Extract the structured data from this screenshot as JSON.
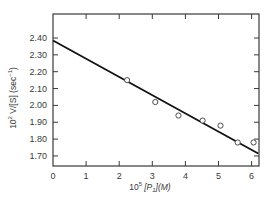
{
  "chart_data": {
    "type": "scatter",
    "title": "",
    "xlabel": "10^5 [P1](M)",
    "ylabel": "10^2 V/[S] (sec^-1)",
    "xlim": [
      0,
      6.2
    ],
    "ylim": [
      1.65,
      2.54
    ],
    "x_ticks": [
      0,
      1,
      2,
      3,
      4,
      5,
      6
    ],
    "x_tick_labels": [
      "0",
      "1",
      "2",
      "3",
      "4",
      "5",
      "6"
    ],
    "y_ticks": [
      1.7,
      1.8,
      1.9,
      2.0,
      2.1,
      2.2,
      2.3,
      2.4
    ],
    "y_tick_labels": [
      "1.70",
      "1.80",
      "1.90",
      "2.00",
      "2.10",
      "2.20",
      "2.30",
      "2.40"
    ],
    "grid": false,
    "legend": null,
    "series": [
      {
        "name": "observed",
        "marker": "open-circle",
        "x": [
          2.24,
          3.09,
          3.79,
          4.52,
          5.06,
          5.58,
          6.06
        ],
        "y": [
          2.15,
          2.02,
          1.94,
          1.91,
          1.88,
          1.78,
          1.78
        ]
      },
      {
        "name": "fit",
        "style": "line",
        "x": [
          0,
          6.2
        ],
        "y": [
          2.385,
          1.715
        ]
      }
    ]
  },
  "labels": {
    "xlabel_prefix": "10",
    "xlabel_exp": "5",
    "xlabel_var": "[P",
    "xlabel_sub": "1",
    "xlabel_suffix": "](M)",
    "ylabel_prefix": "10",
    "ylabel_exp": "2",
    "ylabel_var": " V/[S]  (sec",
    "ylabel_unit_exp": "−1",
    "ylabel_suffix": ")"
  },
  "colors": {
    "axis": "#3a3a3a",
    "line": "#111111",
    "marker": "#3a3a3a"
  }
}
